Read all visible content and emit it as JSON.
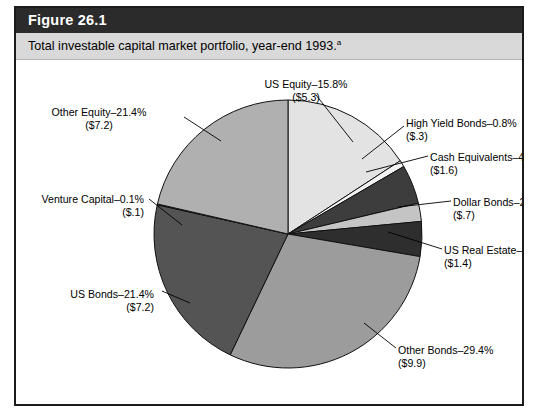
{
  "figure": {
    "number_label": "Figure 26.1",
    "caption": "Total investable capital market portfolio, year-end 1993.",
    "caption_footnote": "a",
    "total_label": "$33.7 Trillion"
  },
  "chart_data": {
    "type": "pie",
    "title": "Total investable capital market portfolio, year-end 1993.",
    "total": "$33.7 Trillion",
    "units": "trillions of US dollars",
    "legend_position": "callout-labels",
    "start_angle_deg": 0,
    "direction": "clockwise",
    "categories": [
      "US Equity",
      "High Yield Bonds",
      "Cash Equivalents",
      "Dollar Bonds",
      "US Real Estate",
      "Other Bonds",
      "US Bonds",
      "Venture Capital",
      "Other Equity"
    ],
    "values": [
      15.8,
      0.8,
      4.7,
      2.2,
      4.2,
      29.4,
      21.4,
      0.1,
      21.4
    ],
    "amounts": [
      5.3,
      0.3,
      1.6,
      0.7,
      1.4,
      9.9,
      7.2,
      0.1,
      7.2
    ],
    "slices": [
      {
        "name": "US Equity",
        "percent": 15.8,
        "percent_text": "15.8%",
        "amount_text": "($5.3)",
        "label": "US Equity–15.8%",
        "color": "#e3e3e3"
      },
      {
        "name": "High Yield Bonds",
        "percent": 0.8,
        "percent_text": "0.8%",
        "amount_text": "($.3)",
        "label": "High Yield Bonds–0.8%",
        "color": "#f2f2f2"
      },
      {
        "name": "Cash Equivalents",
        "percent": 4.7,
        "percent_text": "4.7%",
        "amount_text": "($1.6)",
        "label": "Cash Equivalents–4.7%",
        "color": "#3d3d3d"
      },
      {
        "name": "Dollar Bonds",
        "percent": 2.2,
        "percent_text": "2.2%",
        "amount_text": "($.7)",
        "label": "Dollar Bonds–2.2%",
        "color": "#c4c4c4"
      },
      {
        "name": "US Real Estate",
        "percent": 4.2,
        "percent_text": "4.2%",
        "amount_text": "($1.4)",
        "label": "US Real Estate–4.2%",
        "color": "#2e2e2e"
      },
      {
        "name": "Other Bonds",
        "percent": 29.4,
        "percent_text": "29.4%",
        "amount_text": "($9.9)",
        "label": "Other Bonds–29.4%",
        "color": "#9c9c9c"
      },
      {
        "name": "US Bonds",
        "percent": 21.4,
        "percent_text": "21.4%",
        "amount_text": "($7.2)",
        "label": "US Bonds–21.4%",
        "color": "#545454"
      },
      {
        "name": "Venture Capital",
        "percent": 0.1,
        "percent_text": "0.1%",
        "amount_text": "($.1)",
        "label": "Venture Capital–0.1%",
        "color": "#1a1a1a"
      },
      {
        "name": "Other Equity",
        "percent": 21.4,
        "percent_text": "21.4%",
        "amount_text": "($7.2)",
        "label": "Other Equity–21.4%",
        "color": "#b0b0b0"
      }
    ]
  },
  "geometry": {
    "cx": 272,
    "cy": 174,
    "r": 134,
    "stroke": "#111111"
  },
  "callouts": [
    {
      "key": "us-equity",
      "label_x": 285,
      "label_y": 18,
      "align": "ctr",
      "lx1": 300,
      "ly1": 35,
      "lx2": 337,
      "ly2": 82
    },
    {
      "key": "high-yield-bonds",
      "label_x": 390,
      "label_y": 57,
      "align": "rt",
      "lx1": 388,
      "ly1": 66,
      "lx2": 346,
      "ly2": 99
    },
    {
      "key": "cash-equivalents",
      "label_x": 414,
      "label_y": 91,
      "align": "rt",
      "lx1": 412,
      "ly1": 96,
      "lx2": 350,
      "ly2": 112
    },
    {
      "key": "dollar-bonds",
      "label_x": 437,
      "label_y": 136,
      "align": "rt",
      "lx1": 435,
      "ly1": 141,
      "lx2": 382,
      "ly2": 147
    },
    {
      "key": "us-real-estate",
      "label_x": 428,
      "label_y": 184,
      "align": "rt",
      "lx1": 426,
      "ly1": 189,
      "lx2": 372,
      "ly2": 172
    },
    {
      "key": "other-bonds",
      "label_x": 382,
      "label_y": 284,
      "align": "rt",
      "lx1": 380,
      "ly1": 288,
      "lx2": 348,
      "ly2": 263
    },
    {
      "key": "us-bonds",
      "label_x": 28,
      "label_y": 228,
      "align": "lf",
      "lx1": 146,
      "ly1": 231,
      "lx2": 174,
      "ly2": 243
    },
    {
      "key": "venture-capital",
      "label_x": 18,
      "label_y": 133,
      "align": "lf",
      "lx1": 133,
      "ly1": 139,
      "lx2": 166,
      "ly2": 165
    },
    {
      "key": "other-equity",
      "label_x": 78,
      "label_y": 46,
      "align": "ctr",
      "lx1": 168,
      "ly1": 57,
      "lx2": 205,
      "ly2": 81
    }
  ]
}
